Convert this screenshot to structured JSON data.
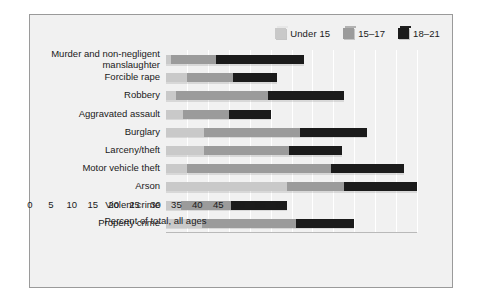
{
  "chart_data": {
    "type": "bar",
    "orientation": "horizontal",
    "stacked": false,
    "overlapping_cumulative": true,
    "title": "",
    "xlabel": "Percent of total, all ages",
    "ylabel": "",
    "xlim": [
      0,
      60
    ],
    "xticks": [
      0,
      5,
      10,
      15,
      20,
      25,
      30,
      35,
      40,
      45,
      50,
      55,
      60
    ],
    "grid": true,
    "legend_position": "top-right",
    "categories": [
      "Murder and non-negligent\nmanslaughter",
      "Forcible rape",
      "Robbery",
      "Aggravated assault",
      "Burglary",
      "Larceny/theft",
      "Motor vehicle theft",
      "Arson",
      "Violent crime",
      "Property crime"
    ],
    "series": [
      {
        "name": "Under 15",
        "color": "#c9c9c9",
        "values": [
          1.2,
          5.0,
          2.5,
          4.0,
          9.0,
          9.0,
          5.0,
          29.0,
          3.5,
          8.5
        ]
      },
      {
        "name": "15–17",
        "color": "#9b9b9b",
        "values": [
          12.0,
          16.0,
          24.5,
          15.0,
          32.0,
          29.5,
          39.5,
          42.5,
          15.5,
          31.0
        ]
      },
      {
        "name": "18–21",
        "color": "#1b1b1b",
        "values": [
          33.0,
          26.5,
          42.5,
          25.0,
          48.0,
          42.0,
          57.0,
          60.0,
          29.0,
          45.0
        ]
      }
    ]
  },
  "legend": {
    "items": [
      {
        "label": "Under 15",
        "color": "#c9c9c9"
      },
      {
        "label": "15–17",
        "color": "#9b9b9b"
      },
      {
        "label": "18–21",
        "color": "#1b1b1b"
      }
    ]
  },
  "axis": {
    "x_title": "Percent of total, all ages",
    "x_ticks": [
      "0",
      "5",
      "10",
      "15",
      "20",
      "25",
      "30",
      "35",
      "40",
      "45",
      "50",
      "55",
      "60"
    ]
  }
}
